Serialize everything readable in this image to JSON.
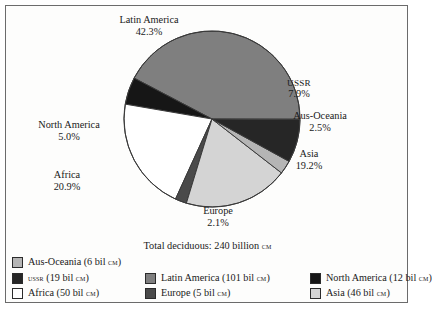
{
  "chart_data": {
    "type": "pie",
    "title": "",
    "total_caption": "Total deciduous: 240 billion ",
    "total_unit": "cm",
    "total_value": 240,
    "unit": "bil cm",
    "categories": [
      "Latin America",
      "USSR",
      "Aus-Oceania",
      "Asia",
      "Europe",
      "Africa",
      "North America"
    ],
    "values": [
      101,
      19,
      6,
      46,
      5,
      50,
      12
    ],
    "percents": [
      42.3,
      7.9,
      2.5,
      19.2,
      2.1,
      20.9,
      5.0
    ],
    "colors": [
      "#7f7f7f",
      "#262626",
      "#b5b5b5",
      "#d4d4d4",
      "#4a4a4a",
      "#ffffff",
      "#161616"
    ],
    "legend_position": "bottom",
    "grid": false
  },
  "slices": [
    {
      "name": "Latin America",
      "percent_label": "42.3%",
      "color": "#7f7f7f"
    },
    {
      "name": "USSR",
      "percent_label": "7.9%",
      "color": "#262626"
    },
    {
      "name": "Aus-Oceania",
      "percent_label": "2.5%",
      "color": "#b5b5b5"
    },
    {
      "name": "Asia",
      "percent_label": "19.2%",
      "color": "#d4d4d4"
    },
    {
      "name": "Europe",
      "percent_label": "2.1%",
      "color": "#4a4a4a"
    },
    {
      "name": "Africa",
      "percent_label": "20.9%",
      "color": "#ffffff"
    },
    {
      "name": "North America",
      "percent_label": "5.0%",
      "color": "#161616"
    }
  ],
  "labels": {
    "latin": {
      "name": "Latin America",
      "percent": "42.3%"
    },
    "ussr": {
      "name": "USSR",
      "percent": "7.9%"
    },
    "aus": {
      "name": "Aus-Oceania",
      "percent": "2.5%"
    },
    "asia": {
      "name": "Asia",
      "percent": "19.2%"
    },
    "europe": {
      "name": "Europe",
      "percent": "2.1%"
    },
    "africa": {
      "name": "Africa",
      "percent": "20.9%"
    },
    "north": {
      "name": "North America",
      "percent": "5.0%"
    }
  },
  "total": {
    "prefix": "Total deciduous: 240 billion ",
    "unit": "cm"
  },
  "legend": {
    "rows": [
      [
        {
          "key": "aus",
          "label_pre": "Aus-Oceania (6 bil ",
          "unit": "cm",
          "label_post": ")",
          "color": "#b5b5b5"
        }
      ],
      [
        {
          "key": "ussr",
          "label_pre": "",
          "small_caps_name": "ussr",
          "label_mid": " (19 bil ",
          "unit": "cm",
          "label_post": ")",
          "color": "#262626"
        },
        {
          "key": "latin",
          "label_pre": "Latin America (101 bil ",
          "unit": "cm",
          "label_post": ")",
          "color": "#7f7f7f"
        },
        {
          "key": "north",
          "label_pre": "North America (12 bil ",
          "unit": "cm",
          "label_post": ")",
          "color": "#161616"
        }
      ],
      [
        {
          "key": "africa",
          "label_pre": "Africa (50 bil ",
          "unit": "cm",
          "label_post": ")",
          "color": "#ffffff"
        },
        {
          "key": "europe",
          "label_pre": "Europe (5 bil ",
          "unit": "cm",
          "label_post": ")",
          "color": "#4a4a4a"
        },
        {
          "key": "asia",
          "label_pre": "Asia (46 bil ",
          "unit": "cm",
          "label_post": ")",
          "color": "#d4d4d4"
        }
      ]
    ]
  }
}
